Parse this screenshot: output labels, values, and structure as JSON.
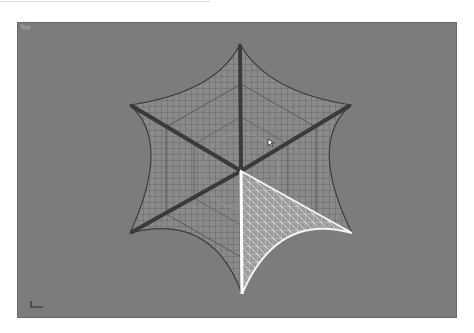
{
  "viewport": {
    "label": "Top",
    "background": "#7c7c7c"
  },
  "scene": {
    "object": "hexagonal-star-mesh-wireframe",
    "center": [
      224,
      149
    ],
    "tips": {
      "top": [
        223,
        22
      ],
      "upper_right": [
        334,
        83
      ],
      "lower_right": [
        335,
        211
      ],
      "bottom": [
        225,
        272
      ],
      "lower_left": [
        113,
        211
      ],
      "upper_left": [
        113,
        83
      ]
    },
    "wire_color": "#3f3f3f",
    "selected_color": "#f2f2f2",
    "selected_segment": "lower-right"
  },
  "colors": {
    "frame": "#ffffff",
    "viewport_border": "#6a6a6a"
  }
}
